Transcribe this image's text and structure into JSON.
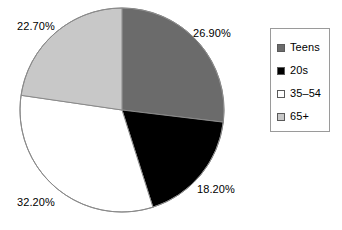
{
  "chart_data": {
    "type": "pie",
    "title": "",
    "categories": [
      "Teens",
      "20s",
      "35–54",
      "65+"
    ],
    "values": [
      26.9,
      18.2,
      32.2,
      22.7
    ],
    "value_labels": [
      "26.90%",
      "18.20%",
      "32.20%",
      "22.70%"
    ],
    "colors": [
      "#6b6b6b",
      "#000000",
      "#ffffff",
      "#c8c8c8"
    ],
    "start_angle_deg": 0,
    "direction": "clockwise",
    "units": "percent",
    "legend_position": "right",
    "grid": false,
    "xlabel": "",
    "ylabel": "",
    "slices": [
      {
        "name": "Teens",
        "value": 26.9,
        "label": "26.90%",
        "color": "#6b6b6b"
      },
      {
        "name": "20s",
        "value": 18.2,
        "label": "18.20%",
        "color": "#000000"
      },
      {
        "name": "35–54",
        "value": 32.2,
        "label": "32.20%",
        "color": "#ffffff"
      },
      {
        "name": "65+",
        "value": 22.7,
        "label": "22.70%",
        "color": "#c8c8c8"
      }
    ]
  },
  "legend": {
    "items": [
      {
        "label": "Teens",
        "swatch_color": "#6b6b6b",
        "icon": "square-swatch-icon"
      },
      {
        "label": "20s",
        "swatch_color": "#000000",
        "icon": "square-swatch-icon"
      },
      {
        "label": "35–54",
        "swatch_color": "#ffffff",
        "icon": "square-swatch-icon"
      },
      {
        "label": "65+",
        "swatch_color": "#c8c8c8",
        "icon": "square-swatch-icon"
      }
    ]
  },
  "style": {
    "background": "#ffffff",
    "outline_color": "#8a8a8a",
    "legend_border": "#9a9a9a",
    "text_color": "#000000"
  }
}
